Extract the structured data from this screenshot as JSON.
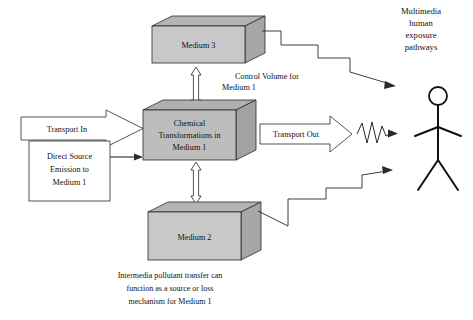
{
  "diagram": {
    "colors": {
      "box_front": "#c8c8c8",
      "box_top": "#b4b4b4",
      "box_side": "#a8a8a8",
      "center_front": "#bdbdbd",
      "outline": "#2a2a2a",
      "white": "#ffffff",
      "text": "#111111"
    },
    "boxes": [
      {
        "name": "medium-3-box",
        "label": "Medium 3"
      },
      {
        "name": "center-box",
        "label_line1": "Chemical",
        "label_line2": "Transformations in",
        "label_line3": "Medium 1"
      },
      {
        "name": "medium-2-box",
        "label": "Medium 2"
      }
    ],
    "flows": {
      "transport_in": "Transport In",
      "transport_out": "Transport Out",
      "direct_source_line1": "Direct Source",
      "direct_source_line2": "Emission to",
      "direct_source_line3": "Medium 1"
    },
    "annotations": {
      "control_volume_line1": "Control Volume for",
      "control_volume_line2": "Medium 1",
      "exposure_line1": "Multimedia",
      "exposure_line2": "human",
      "exposure_line3": "exposure",
      "exposure_line4": "pathways",
      "caption_line1": "Intermedia pollutant transfer can",
      "caption_line2": "function as a source or loss",
      "caption_line3": "mechanism for Medium 1"
    },
    "icons": {
      "stick_figure": "person-icon",
      "up_down_arrow_top": "double-headed-arrow-icon",
      "up_down_arrow_bottom": "double-headed-arrow-icon",
      "zigzag_top": "zigzag-pathway-arrow-icon",
      "zigzag_bottom": "zigzag-pathway-arrow-icon",
      "squiggle": "wavy-arrow-icon",
      "block_arrow_in": "block-arrow-right-icon",
      "block_arrow_out": "block-arrow-right-icon",
      "thin_arrow_source": "arrow-right-icon"
    }
  }
}
